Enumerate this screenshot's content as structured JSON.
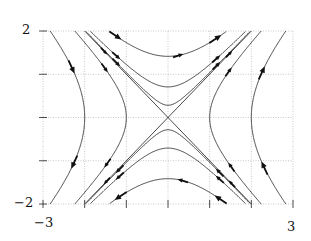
{
  "figure": {
    "type": "phase-portrait",
    "xlim": [
      -3,
      3
    ],
    "ylim": [
      -2,
      2
    ],
    "axis_labels": {
      "y_top": "2",
      "y_bottom": "−2",
      "x_left": "−3",
      "x_right": "3"
    },
    "grid": {
      "x_ticks": [
        -3,
        -2,
        -1,
        0,
        1,
        2,
        3
      ],
      "y_ticks": [
        -2,
        -1,
        0,
        1,
        2
      ],
      "style": "dotted"
    },
    "trajectories": {
      "side_branches_c": [
        4,
        1
      ],
      "top_bottom_branches_c": [
        2,
        0.5,
        0.08
      ],
      "asymptotes": [
        "y=x",
        "y=-x"
      ]
    },
    "colors": {
      "line": "#333333",
      "grid": "#bbbbbb",
      "arrow": "#111111"
    }
  }
}
